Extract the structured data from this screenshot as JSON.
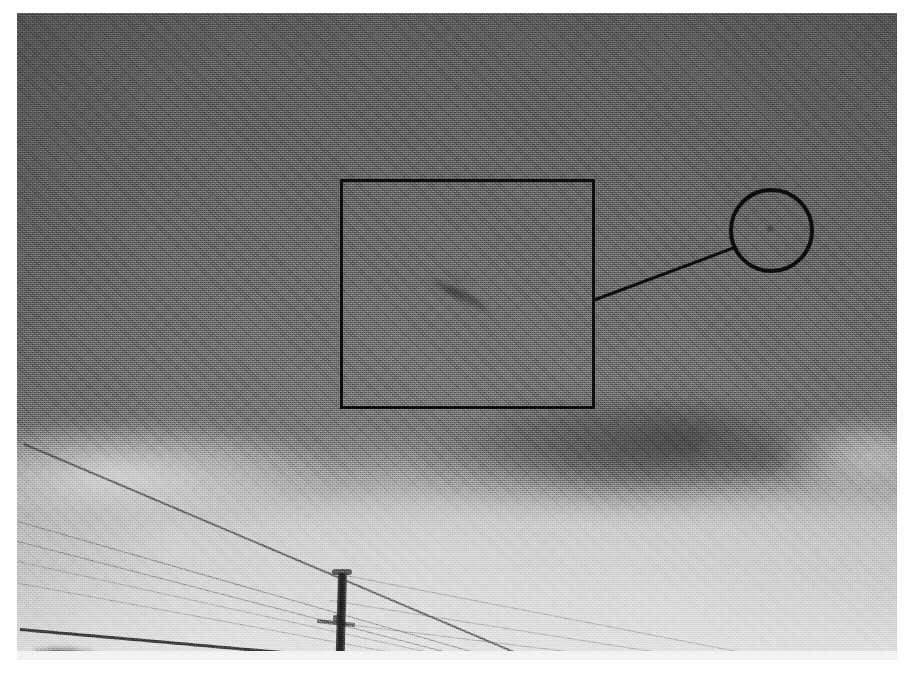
{
  "page": {
    "background_color": "#ffffff",
    "width": 912,
    "height": 675
  },
  "photograph": {
    "name": "annotated-storm-sky-photograph",
    "media_type": "grayscale halftone print scan",
    "frame": {
      "left": 17,
      "top": 13,
      "width": 880,
      "height": 647
    },
    "scene_description": "Dark storm cloud deck over a brighter cloud base, with overhead power lines and a utility pole in the lower portion of the frame.",
    "tonal_range": {
      "sky_top_color": "#565656",
      "cloud_deck_color": "#6b6b6b",
      "cloud_base_color": "#d6d6d6",
      "bright_lower_sky_color": "#dcdcdc"
    }
  },
  "annotations": {
    "square_callout": {
      "label": "region-of-interest-box",
      "shape": "square",
      "stroke_color": "#0d0d0d",
      "stroke_width": 3,
      "left": 323,
      "top": 166,
      "width": 255,
      "height": 230
    },
    "circle_callout": {
      "label": "magnified-detail-circle",
      "shape": "circle",
      "stroke_color": "#0d0d0d",
      "stroke_width": 4,
      "center_x": 754,
      "center_y": 217,
      "radius": 42
    },
    "leader_line": {
      "label": "callout-connector",
      "stroke_color": "#0d0d0d",
      "stroke_width": 3,
      "from_x": 578,
      "from_y": 288,
      "to_x": 714,
      "to_y": 238
    },
    "subject_feature": {
      "label": "dark-diagonal-streak",
      "description": "Faint dark diagonal streak inside the boxed region, oriented upper-left to lower-right.",
      "center_x": 450,
      "center_y": 287,
      "angle_degrees": 27
    }
  },
  "foreground": {
    "utility_pole": {
      "label": "utility-pole",
      "left": 321,
      "top": 560,
      "width": 9,
      "height": 100,
      "color": "#1e1e1e"
    },
    "power_lines": [
      {
        "label": "wire-upper-steep",
        "x": 24,
        "y": 443,
        "length": 560,
        "angle": 23.0,
        "weight": "normal"
      },
      {
        "label": "wire-second",
        "x": 14,
        "y": 520,
        "length": 600,
        "angle": 16.0,
        "weight": "soft"
      },
      {
        "label": "wire-third",
        "x": 14,
        "y": 540,
        "length": 620,
        "angle": 14.5,
        "weight": "soft"
      },
      {
        "label": "wire-fourth",
        "x": 14,
        "y": 560,
        "length": 640,
        "angle": 12.5,
        "weight": "faint"
      },
      {
        "label": "wire-fifth",
        "x": 14,
        "y": 582,
        "length": 650,
        "angle": 10.5,
        "weight": "faint"
      },
      {
        "label": "wire-bottom-heavy",
        "x": 20,
        "y": 628,
        "length": 560,
        "angle": 5.0,
        "weight": "heavy"
      },
      {
        "label": "wire-right-upper",
        "x": 330,
        "y": 572,
        "length": 570,
        "angle": 11.0,
        "weight": "faint"
      },
      {
        "label": "wire-right-lower",
        "x": 330,
        "y": 600,
        "length": 570,
        "angle": 9.0,
        "weight": "faint"
      },
      {
        "label": "wire-right-lowest",
        "x": 330,
        "y": 622,
        "length": 560,
        "angle": 7.0,
        "weight": "faint"
      }
    ],
    "ground_object": {
      "label": "dark-foreground-object",
      "description": "Small dark mass at the lower-left corner of the frame."
    }
  }
}
